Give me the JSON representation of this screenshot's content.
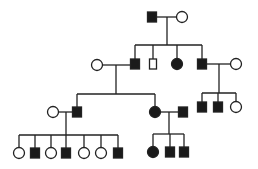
{
  "diagram": {
    "type": "pedigree",
    "colors": {
      "line": "#222222",
      "affected": "#1a1a1a",
      "unaffected_fill": "#ffffff"
    },
    "individuals": [
      {
        "id": "I-1",
        "sex": "male",
        "affected": true,
        "x": 152,
        "y": 17
      },
      {
        "id": "I-2",
        "sex": "female",
        "affected": false,
        "x": 182,
        "y": 17
      },
      {
        "id": "II-0",
        "sex": "female",
        "affected": false,
        "x": 97,
        "y": 65
      },
      {
        "id": "II-1",
        "sex": "male",
        "affected": true,
        "x": 135,
        "y": 64
      },
      {
        "id": "II-2",
        "sex": "male",
        "affected": false,
        "x": 153,
        "y": 64,
        "narrow": true
      },
      {
        "id": "II-3",
        "sex": "female",
        "affected": true,
        "x": 177,
        "y": 64
      },
      {
        "id": "II-4",
        "sex": "male",
        "affected": true,
        "x": 202,
        "y": 64
      },
      {
        "id": "II-5",
        "sex": "female",
        "affected": false,
        "x": 236,
        "y": 64
      },
      {
        "id": "III-0",
        "sex": "female",
        "affected": false,
        "x": 53,
        "y": 112
      },
      {
        "id": "III-1",
        "sex": "male",
        "affected": true,
        "x": 77,
        "y": 112
      },
      {
        "id": "III-2",
        "sex": "female",
        "affected": true,
        "x": 155,
        "y": 112
      },
      {
        "id": "III-3",
        "sex": "male",
        "affected": true,
        "x": 183,
        "y": 112
      },
      {
        "id": "III-4",
        "sex": "male",
        "affected": true,
        "x": 202,
        "y": 107
      },
      {
        "id": "III-5",
        "sex": "male",
        "affected": true,
        "x": 218,
        "y": 107
      },
      {
        "id": "III-6",
        "sex": "female",
        "affected": false,
        "x": 236,
        "y": 107
      },
      {
        "id": "IV-1",
        "sex": "female",
        "affected": false,
        "x": 19,
        "y": 153
      },
      {
        "id": "IV-2",
        "sex": "male",
        "affected": true,
        "x": 35,
        "y": 153
      },
      {
        "id": "IV-3",
        "sex": "female",
        "affected": false,
        "x": 51,
        "y": 153
      },
      {
        "id": "IV-4",
        "sex": "male",
        "affected": true,
        "x": 66,
        "y": 153
      },
      {
        "id": "IV-5",
        "sex": "female",
        "affected": false,
        "x": 84,
        "y": 153
      },
      {
        "id": "IV-6",
        "sex": "female",
        "affected": false,
        "x": 101,
        "y": 153
      },
      {
        "id": "IV-7",
        "sex": "male",
        "affected": true,
        "x": 118,
        "y": 153
      },
      {
        "id": "IV-8",
        "sex": "female",
        "affected": true,
        "x": 153,
        "y": 152
      },
      {
        "id": "IV-9",
        "sex": "male",
        "affected": true,
        "x": 170,
        "y": 152
      },
      {
        "id": "IV-10",
        "sex": "male",
        "affected": true,
        "x": 184,
        "y": 152
      }
    ],
    "lines": [
      [
        157,
        17,
        177,
        17
      ],
      [
        167,
        17,
        167,
        45
      ],
      [
        135,
        45,
        202,
        45
      ],
      [
        135,
        45,
        135,
        59
      ],
      [
        153,
        45,
        153,
        59
      ],
      [
        177,
        45,
        177,
        59
      ],
      [
        202,
        45,
        202,
        59
      ],
      [
        102,
        65,
        130,
        65
      ],
      [
        116,
        65,
        116,
        94
      ],
      [
        77,
        94,
        155,
        94
      ],
      [
        77,
        94,
        77,
        107
      ],
      [
        155,
        94,
        155,
        107
      ],
      [
        207,
        64,
        231,
        64
      ],
      [
        219,
        64,
        219,
        93
      ],
      [
        202,
        93,
        236,
        93
      ],
      [
        202,
        93,
        202,
        102
      ],
      [
        218,
        93,
        218,
        102
      ],
      [
        236,
        93,
        236,
        102
      ],
      [
        58,
        112,
        72,
        112
      ],
      [
        66,
        112,
        66,
        135
      ],
      [
        19,
        135,
        118,
        135
      ],
      [
        19,
        135,
        19,
        148
      ],
      [
        35,
        135,
        35,
        148
      ],
      [
        51,
        135,
        51,
        148
      ],
      [
        66,
        135,
        66,
        148
      ],
      [
        84,
        135,
        84,
        148
      ],
      [
        101,
        135,
        101,
        148
      ],
      [
        118,
        135,
        118,
        148
      ],
      [
        160,
        112,
        178,
        112
      ],
      [
        169,
        112,
        169,
        134
      ],
      [
        153,
        134,
        184,
        134
      ],
      [
        153,
        134,
        153,
        147
      ],
      [
        170,
        134,
        170,
        147
      ],
      [
        184,
        134,
        184,
        147
      ]
    ]
  }
}
